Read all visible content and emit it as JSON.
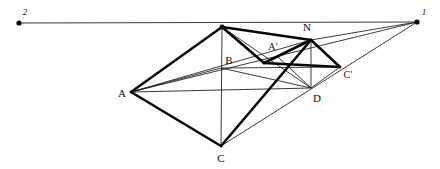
{
  "figure": {
    "type": "geometric-construction",
    "width": 440,
    "height": 169,
    "background_color": "#ffffff",
    "ink_color": "#111111"
  },
  "labels": {
    "vanishing_point_1": "1",
    "vanishing_point_2": "2",
    "point_a": "A",
    "point_b": "B",
    "point_c": "C",
    "point_d": "D",
    "point_n": "N",
    "point_a_prime": "A'",
    "point_c_prime": "C'"
  },
  "label_positions": {
    "vanishing_point_2": {
      "x": 25,
      "y": 12
    },
    "vanishing_point_1": {
      "x": 424,
      "y": 12
    },
    "point_a": {
      "x": 122,
      "y": 93
    },
    "point_b": {
      "x": 229,
      "y": 60
    },
    "point_c": {
      "x": 221,
      "y": 158
    },
    "point_d": {
      "x": 317,
      "y": 98
    },
    "point_n": {
      "x": 307,
      "y": 27
    },
    "point_a_prime": {
      "x": 273,
      "y": 47
    },
    "point_c_prime": {
      "x": 348,
      "y": 75
    }
  },
  "vertices": {
    "VP2": {
      "x": 19,
      "y": 23
    },
    "VP1": {
      "x": 417,
      "y": 22
    },
    "A": {
      "x": 131,
      "y": 92
    },
    "B": {
      "x": 221,
      "y": 68
    },
    "C": {
      "x": 221,
      "y": 146
    },
    "D": {
      "x": 311,
      "y": 88
    },
    "N": {
      "x": 311,
      "y": 40
    },
    "Ap": {
      "x": 277,
      "y": 56
    },
    "Cp": {
      "x": 340,
      "y": 67
    },
    "T": {
      "x": 222,
      "y": 27
    }
  },
  "dots": [
    {
      "name": "dot-vp2",
      "x": 19,
      "y": 23,
      "r": 2.6
    },
    {
      "name": "dot-vp1",
      "x": 417,
      "y": 22,
      "r": 2.6
    },
    {
      "name": "dot-apex",
      "x": 222,
      "y": 27,
      "r": 2.4
    }
  ],
  "strokes": {
    "horizon_line": {
      "width": 1.0,
      "color": "#3a3a3a"
    },
    "thin": {
      "width": 0.85,
      "color": "#1a1a1a"
    },
    "thick": {
      "width": 2.6,
      "color": "#080808"
    }
  },
  "edges_thick": [
    {
      "name": "edge-A-T",
      "from": "A",
      "to": "T"
    },
    {
      "name": "edge-A-C",
      "from": "A",
      "to": "C"
    },
    {
      "name": "edge-T-N",
      "from": "T",
      "to": "N"
    },
    {
      "name": "edge-N-Cp",
      "from": "N",
      "to": "Cp"
    },
    {
      "name": "edge-N-D",
      "from": "N",
      "to": "D"
    },
    {
      "name": "edge-C-N",
      "from": "C",
      "to": "N"
    },
    {
      "name": "edge-Ap-Cp",
      "from": "Ap",
      "to": "Cp"
    },
    {
      "name": "edge-T-Ap",
      "from": "T",
      "to": "Ap"
    }
  ],
  "edges_thin": [
    {
      "name": "line-horizon",
      "from": "VP2",
      "to": "VP1"
    },
    {
      "name": "line-A-VP1",
      "from": "A",
      "to": "VP1"
    },
    {
      "name": "line-A-D",
      "from": "A",
      "to": "D"
    },
    {
      "name": "line-A-N",
      "from": "A",
      "to": "N"
    },
    {
      "name": "line-T-C",
      "from": "T",
      "to": "C"
    },
    {
      "name": "line-C-VP1",
      "from": "C",
      "to": "VP1"
    },
    {
      "name": "line-C-Cp",
      "from": "C",
      "to": "Cp"
    },
    {
      "name": "line-N-VP1",
      "from": "N",
      "to": "VP1"
    },
    {
      "name": "line-N-D-vert",
      "from": "N",
      "to": "D"
    },
    {
      "name": "line-D-Cp",
      "from": "D",
      "to": "Cp"
    },
    {
      "name": "line-B-D",
      "from": "B",
      "to": "D"
    },
    {
      "name": "line-B-Cp",
      "from": "B",
      "to": "Cp"
    },
    {
      "name": "line-T-D",
      "from": "T",
      "to": "D"
    },
    {
      "name": "line-Ap-D",
      "from": "Ap",
      "to": "D"
    }
  ]
}
